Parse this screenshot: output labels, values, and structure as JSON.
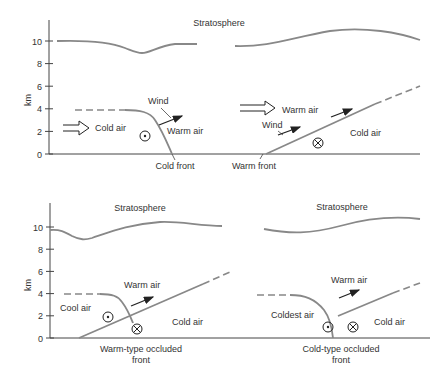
{
  "figure": {
    "top_panel": {
      "ylabel": "km",
      "ticks": [
        "0",
        "2",
        "4",
        "6",
        "8",
        "10"
      ],
      "stratosphere_label": "Stratosphere",
      "left": {
        "cold_air_label": "Cold air",
        "warm_air_label": "Warm air",
        "wind_label": "Wind",
        "front_label": "Cold front",
        "symbol": "out-of-page (⊙)"
      },
      "right": {
        "warm_air_label": "Warm air",
        "cold_air_label": "Cold air",
        "wind_label": "Wind",
        "front_label": "Warm front",
        "symbol": "into-page (⊗)"
      }
    },
    "bottom_panel": {
      "ylabel": "km",
      "ticks": [
        "0",
        "2",
        "4",
        "6",
        "8",
        "10"
      ],
      "left": {
        "stratosphere_label": "Stratosphere",
        "cool_air_label": "Cool air",
        "warm_air_label": "Warm air",
        "cold_air_label": "Cold air",
        "caption_line1": "Warm-type occluded",
        "caption_line2": "front"
      },
      "right": {
        "stratosphere_label": "Stratosphere",
        "coldest_air_label": "Coldest air",
        "warm_air_label": "Warm air",
        "cold_air_label": "Cold air",
        "caption_line1": "Cold-type occluded",
        "caption_line2": "front"
      }
    },
    "colors": {
      "boundary": "#888888",
      "axis": "#444444",
      "text": "#333333"
    }
  }
}
